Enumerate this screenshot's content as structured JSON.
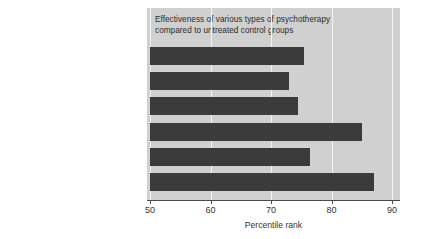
{
  "chart_data": {
    "type": "bar",
    "orientation": "horizontal",
    "title": "Effectiveness of various types of psychotherapy\ncompared to untreated control groups",
    "xlabel": "Percentile rank",
    "ylabel": "",
    "xlim": [
      50,
      90
    ],
    "xticks": [
      50,
      60,
      70,
      80,
      90
    ],
    "xtick_labels": [
      "50",
      "60",
      "70",
      "80",
      "90"
    ],
    "grid": true,
    "grid_axis": "x",
    "legend": false,
    "categories": [
      "Psychoanalytic",
      "Client-centered",
      "Transactional analysis",
      "Systematic desensitization",
      "Behavior modification",
      "Cognitive-behavioral"
    ],
    "values": [
      75.5,
      73,
      74.5,
      85,
      76.5,
      87
    ],
    "bar_color": "#3b3b3b",
    "panel_color": "#d0d0d0",
    "gridline_color": "#f4f4f4"
  },
  "colors": {
    "bar": "#3b3b3b",
    "panel": "#d0d0d0",
    "grid": "#f4f4f4",
    "text": "#333333",
    "axis": "#4a4a4a",
    "background": "#ffffff"
  }
}
